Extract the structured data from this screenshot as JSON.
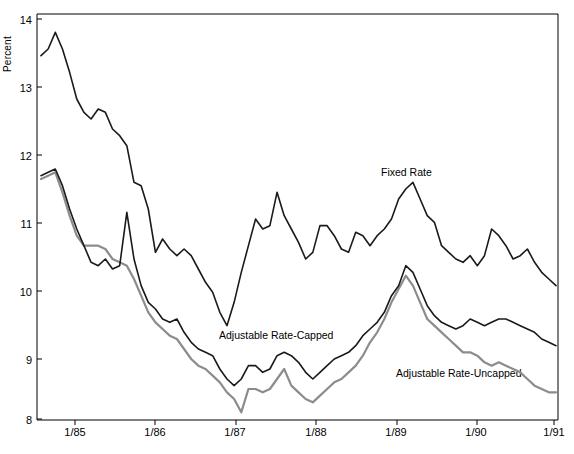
{
  "chart_data": {
    "type": "line",
    "title": "",
    "xlabel": "",
    "ylabel": "Percent",
    "ylim": [
      8,
      14
    ],
    "yticks": [
      8,
      9,
      10,
      11,
      12,
      13,
      14
    ],
    "xticks": [
      "1/85",
      "1/86",
      "1/87",
      "1/88",
      "1/89",
      "1/90",
      "1/91"
    ],
    "grid": false,
    "legend_position": "inline-annotations",
    "annotations": [
      {
        "text": "Fixed Rate",
        "x": "mid-1989",
        "y": 11.8
      },
      {
        "text": "Adjustable Rate-Capped",
        "x": "late-1987",
        "y": 9.35
      },
      {
        "text": "Adjustable Rate-Uncapped",
        "x": "mid-1990",
        "y": 8.85
      }
    ],
    "x_start": "1/85",
    "x_end": "1/91",
    "x_step_months": 1,
    "series": [
      {
        "name": "Fixed Rate",
        "color": "#1a1a1a",
        "values": [
          13.45,
          13.55,
          13.8,
          13.55,
          13.2,
          12.8,
          12.6,
          12.5,
          12.65,
          12.6,
          12.35,
          12.25,
          12.1,
          11.55,
          11.5,
          11.15,
          10.5,
          10.7,
          10.55,
          10.45,
          10.55,
          10.45,
          10.25,
          10.05,
          9.9,
          9.6,
          9.4,
          9.75,
          10.2,
          10.6,
          11.0,
          10.85,
          10.9,
          11.4,
          11.05,
          10.85,
          10.65,
          10.4,
          10.5,
          10.9,
          10.9,
          10.75,
          10.55,
          10.5,
          10.8,
          10.75,
          10.6,
          10.75,
          10.85,
          11.0,
          11.3,
          11.45,
          11.55,
          11.3,
          11.05,
          10.95,
          10.6,
          10.5,
          10.4,
          10.35,
          10.45,
          10.3,
          10.45,
          10.85,
          10.75,
          10.6,
          10.4,
          10.45,
          10.55,
          10.35,
          10.2,
          10.1,
          10.0
        ]
      },
      {
        "name": "Adjustable Rate-Capped",
        "color": "#1a1a1a",
        "values": [
          11.65,
          11.7,
          11.75,
          11.5,
          11.15,
          10.85,
          10.6,
          10.35,
          10.3,
          10.4,
          10.25,
          10.3,
          11.1,
          10.4,
          10.0,
          9.75,
          9.65,
          9.5,
          9.45,
          9.5,
          9.3,
          9.15,
          9.05,
          9.0,
          8.95,
          8.75,
          8.6,
          8.5,
          8.6,
          8.8,
          8.8,
          8.7,
          8.75,
          8.95,
          9.0,
          8.95,
          8.85,
          8.7,
          8.6,
          8.7,
          8.8,
          8.9,
          8.95,
          9.0,
          9.1,
          9.25,
          9.35,
          9.45,
          9.6,
          9.85,
          10.0,
          10.3,
          10.2,
          9.95,
          9.7,
          9.55,
          9.45,
          9.4,
          9.35,
          9.4,
          9.5,
          9.45,
          9.4,
          9.45,
          9.5,
          9.5,
          9.45,
          9.4,
          9.35,
          9.3,
          9.2,
          9.15,
          9.1
        ]
      },
      {
        "name": "Adjustable Rate-Uncapped",
        "color": "#8c8c8c",
        "values": [
          11.6,
          11.65,
          11.7,
          11.4,
          11.05,
          10.75,
          10.6,
          10.6,
          10.6,
          10.55,
          10.4,
          10.35,
          10.3,
          10.1,
          9.85,
          9.6,
          9.45,
          9.35,
          9.25,
          9.2,
          9.05,
          8.9,
          8.8,
          8.75,
          8.65,
          8.55,
          8.4,
          8.3,
          8.1,
          8.45,
          8.45,
          8.4,
          8.45,
          8.6,
          8.75,
          8.5,
          8.4,
          8.3,
          8.25,
          8.35,
          8.45,
          8.55,
          8.6,
          8.7,
          8.8,
          8.95,
          9.15,
          9.3,
          9.5,
          9.75,
          9.95,
          10.15,
          10.0,
          9.75,
          9.5,
          9.4,
          9.3,
          9.2,
          9.1,
          9.0,
          9.0,
          8.95,
          8.85,
          8.8,
          8.85,
          8.8,
          8.75,
          8.7,
          8.6,
          8.5,
          8.45,
          8.4,
          8.4
        ]
      }
    ]
  },
  "axis": {
    "y_title": "Percent",
    "y_labels": [
      "14",
      "13",
      "12",
      "11",
      "10",
      "9",
      "8"
    ],
    "x_labels": [
      "1/85",
      "1/86",
      "1/87",
      "1/88",
      "1/89",
      "1/90",
      "1/91"
    ]
  },
  "labels": {
    "fixed_rate": "Fixed Rate",
    "adjustable_capped": "Adjustable Rate-Capped",
    "adjustable_uncapped": "Adjustable Rate-Uncapped"
  }
}
